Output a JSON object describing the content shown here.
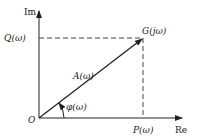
{
  "diagram": {
    "axes": {
      "imaginary": "Im",
      "real": "Re"
    },
    "origin": "O",
    "point": "G(jω)",
    "magnitude": "A(ω)",
    "phase": "φ(ω)",
    "imag_part": "Q(ω)",
    "real_part": "P(ω)"
  },
  "colors": {
    "stroke": "#222222"
  }
}
